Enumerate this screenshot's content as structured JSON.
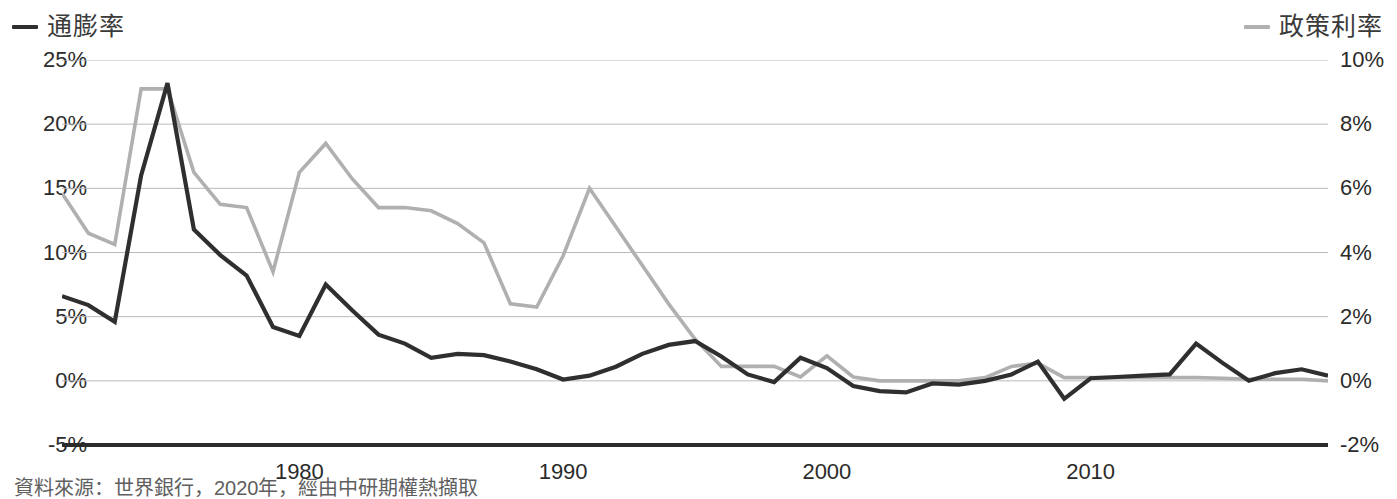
{
  "legend": {
    "left": {
      "label": "通膨率",
      "color": "#2f2f2f"
    },
    "right": {
      "label": "政策利率",
      "color": "#b0b0b0"
    }
  },
  "caption": "資料來源：世界銀行，2020年，經由中研期權熱擷取",
  "axes": {
    "left_ticks": [
      "25%",
      "20%",
      "15%",
      "10%",
      "5%",
      "0%",
      "-5%"
    ],
    "right_ticks": [
      "10%",
      "8%",
      "6%",
      "4%",
      "2%",
      "0%",
      "-2%"
    ],
    "x_ticks": [
      "1980",
      "1990",
      "2000",
      "2010"
    ]
  },
  "chart_data": {
    "type": "line",
    "title": "",
    "xlabel": "",
    "ylabel": "",
    "y_left_label": "通膨率",
    "y_right_label": "政策利率",
    "ylim_left": [
      -5,
      25
    ],
    "ylim_right": [
      -2,
      10
    ],
    "xlim": [
      1971,
      2019
    ],
    "grid": true,
    "legend_position": "top",
    "left_axis_ticks": [
      25,
      20,
      15,
      10,
      5,
      0,
      -5
    ],
    "right_axis_ticks": [
      10,
      8,
      6,
      4,
      2,
      0,
      -2
    ],
    "x_tick_values": [
      1980,
      1990,
      2000,
      2010
    ],
    "x": [
      1971,
      1972,
      1973,
      1974,
      1975,
      1976,
      1977,
      1978,
      1979,
      1980,
      1981,
      1982,
      1983,
      1984,
      1985,
      1986,
      1987,
      1988,
      1989,
      1990,
      1991,
      1992,
      1993,
      1994,
      1995,
      1996,
      1997,
      1998,
      1999,
      2000,
      2001,
      2002,
      2003,
      2004,
      2005,
      2006,
      2007,
      2008,
      2009,
      2010,
      2011,
      2012,
      2013,
      2014,
      2015,
      2016,
      2017,
      2018,
      2019
    ],
    "series": [
      {
        "name": "通膨率",
        "axis": "left",
        "color": "#2f2f2f",
        "units": "%",
        "values": [
          6.6,
          5.9,
          4.6,
          16.0,
          23.2,
          11.8,
          9.8,
          8.2,
          4.2,
          3.5,
          7.5,
          5.5,
          3.6,
          2.9,
          1.8,
          2.1,
          2.0,
          1.5,
          0.9,
          0.1,
          0.4,
          1.1,
          2.1,
          2.8,
          3.1,
          1.9,
          0.5,
          -0.1,
          1.8,
          1.0,
          -0.4,
          -0.8,
          -0.9,
          -0.2,
          -0.3,
          0.0,
          0.5,
          1.5,
          -1.4,
          0.2,
          0.3,
          0.4,
          0.5,
          2.9,
          1.4,
          0.0,
          0.6,
          0.9,
          0.4
        ]
      },
      {
        "name": "政策利率",
        "axis": "right",
        "color": "#b0b0b0",
        "units": "%",
        "values": [
          5.85,
          4.6,
          4.25,
          9.1,
          9.1,
          6.5,
          5.5,
          5.4,
          3.4,
          6.5,
          7.4,
          6.3,
          5.4,
          5.4,
          5.3,
          4.9,
          4.3,
          2.4,
          2.3,
          3.9,
          6.0,
          4.8,
          3.6,
          2.4,
          1.3,
          0.45,
          0.45,
          0.45,
          0.12,
          0.78,
          0.12,
          0.0,
          0.0,
          0.0,
          0.0,
          0.1,
          0.45,
          0.55,
          0.1,
          0.1,
          0.1,
          0.1,
          0.1,
          0.1,
          0.08,
          0.05,
          0.05,
          0.05,
          0.0
        ]
      }
    ]
  }
}
